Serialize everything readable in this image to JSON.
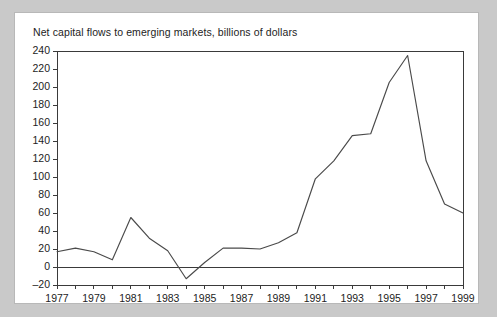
{
  "figure": {
    "background_color": "#c9c9c9",
    "card_color": "#ffffff",
    "border_color": "#b8b8b8"
  },
  "chart_data": {
    "type": "line",
    "title": "Net capital flows to emerging markets, billions of dollars",
    "xlabel": "",
    "ylabel": "",
    "xlim": [
      1977,
      1999
    ],
    "ylim": [
      -20,
      240
    ],
    "ytick_step": 20,
    "xtick_step": 2,
    "grid": false,
    "legend": "none",
    "line_color": "#4a4a4a",
    "axis_color": "#3a3a3a",
    "zero_line": true,
    "yticks": [
      -20,
      0,
      20,
      40,
      60,
      80,
      100,
      120,
      140,
      160,
      180,
      200,
      220,
      240
    ],
    "ytick_labels": [
      "–20",
      "0",
      "20",
      "40",
      "60",
      "80",
      "100",
      "120",
      "140",
      "160",
      "180",
      "200",
      "220",
      "240"
    ],
    "xticks": [
      1977,
      1979,
      1981,
      1983,
      1985,
      1987,
      1989,
      1991,
      1993,
      1995,
      1997,
      1999
    ],
    "xtick_labels": [
      "1977",
      "1979",
      "1981",
      "1983",
      "1985",
      "1987",
      "1989",
      "1991",
      "1993",
      "1995",
      "1997",
      "1999"
    ],
    "x": [
      1977,
      1978,
      1979,
      1980,
      1981,
      1982,
      1983,
      1984,
      1985,
      1986,
      1987,
      1988,
      1989,
      1990,
      1991,
      1992,
      1993,
      1994,
      1995,
      1996,
      1997,
      1998,
      1999
    ],
    "values": [
      17,
      21,
      17,
      8,
      55,
      32,
      18,
      -13,
      5,
      21,
      21,
      20,
      27,
      38,
      98,
      118,
      146,
      148,
      205,
      235,
      118,
      70,
      60
    ],
    "series": [
      {
        "name": "Net capital flows to emerging markets",
        "values": [
          17,
          21,
          17,
          8,
          55,
          32,
          18,
          -13,
          5,
          21,
          21,
          20,
          27,
          38,
          98,
          118,
          146,
          148,
          205,
          235,
          118,
          70,
          60
        ]
      }
    ]
  }
}
